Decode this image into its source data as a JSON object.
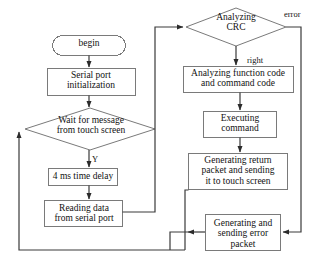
{
  "diagram": {
    "stroke_color": "#6f6f6f",
    "text_color": "#121212",
    "background": "#ffffff",
    "nodes": [
      {
        "id": "begin",
        "shape": "terminator",
        "label": "begin"
      },
      {
        "id": "serial",
        "shape": "process",
        "label": "Serial port\ninitialization"
      },
      {
        "id": "wait",
        "shape": "decision",
        "label": "Wait for message\nfrom touch screen"
      },
      {
        "id": "delay",
        "shape": "process",
        "label": "4 ms time delay"
      },
      {
        "id": "reading",
        "shape": "process",
        "label": "Reading data\nfrom serial port"
      },
      {
        "id": "crc",
        "shape": "decision",
        "label": "Analyzing\nCRC"
      },
      {
        "id": "func",
        "shape": "process",
        "label": "Analyzing  function code\nand command code"
      },
      {
        "id": "exec",
        "shape": "process",
        "label": "Executing\ncommand"
      },
      {
        "id": "genret",
        "shape": "process",
        "label": "Generating return\npacket and sending\nit to touch screen"
      },
      {
        "id": "generr",
        "shape": "process",
        "label": "Generating and\nsending error\npacket"
      }
    ],
    "edge_labels": {
      "error": "error",
      "right": "right",
      "yes": "Y"
    }
  }
}
